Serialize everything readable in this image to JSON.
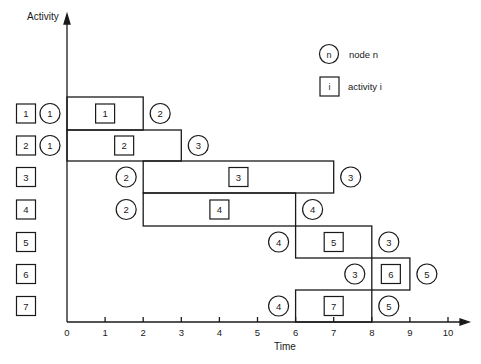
{
  "axes": {
    "y_label": "Activity",
    "x_label": "Time",
    "x_ticks": [
      "0",
      "1",
      "2",
      "3",
      "4",
      "5",
      "6",
      "7",
      "8",
      "9",
      "10"
    ]
  },
  "legend": {
    "node_symbol": "n",
    "node_label": "node n",
    "activity_symbol": "i",
    "activity_label": "activity i"
  },
  "rows": [
    {
      "activity": "1",
      "start": 0,
      "end": 2,
      "start_node": "1",
      "end_node": "2"
    },
    {
      "activity": "2",
      "start": 0,
      "end": 3,
      "start_node": "1",
      "end_node": "3"
    },
    {
      "activity": "3",
      "start": 2,
      "end": 7,
      "start_node": "2",
      "end_node": "3"
    },
    {
      "activity": "4",
      "start": 2,
      "end": 6,
      "start_node": "2",
      "end_node": "4"
    },
    {
      "activity": "5",
      "start": 6,
      "end": 8,
      "start_node": "4",
      "end_node": "3"
    },
    {
      "activity": "6",
      "start": 8,
      "end": 9,
      "start_node": "3",
      "end_node": "5"
    },
    {
      "activity": "7",
      "start": 6,
      "end": 8,
      "start_node": "4",
      "end_node": "5"
    }
  ],
  "chart_data": {
    "type": "gantt",
    "title": "",
    "xlabel": "Time",
    "ylabel": "Activity",
    "xlim": [
      0,
      10
    ],
    "categories": [
      "1",
      "2",
      "3",
      "4",
      "5",
      "6",
      "7"
    ],
    "tasks": [
      {
        "activity": 1,
        "start": 0,
        "end": 2,
        "from_node": 1,
        "to_node": 2
      },
      {
        "activity": 2,
        "start": 0,
        "end": 3,
        "from_node": 1,
        "to_node": 3
      },
      {
        "activity": 3,
        "start": 2,
        "end": 7,
        "from_node": 2,
        "to_node": 3
      },
      {
        "activity": 4,
        "start": 2,
        "end": 6,
        "from_node": 2,
        "to_node": 4
      },
      {
        "activity": 5,
        "start": 6,
        "end": 8,
        "from_node": 4,
        "to_node": 3
      },
      {
        "activity": 6,
        "start": 8,
        "end": 9,
        "from_node": 3,
        "to_node": 5
      },
      {
        "activity": 7,
        "start": 6,
        "end": 8,
        "from_node": 4,
        "to_node": 5
      }
    ],
    "legend": [
      "circle = node n",
      "square = activity i"
    ]
  }
}
